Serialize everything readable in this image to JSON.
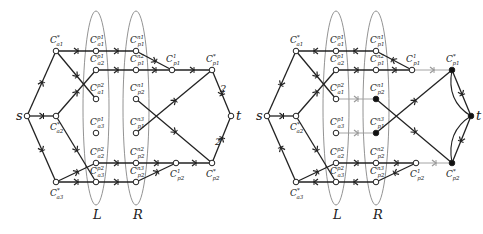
{
  "colors": {
    "edge": "#222222",
    "edge_light": "#9a9a9a",
    "ellipse": "#777777",
    "node_fill_open": "#ffffff",
    "node_fill_closed": "#111111"
  },
  "diagrams": [
    {
      "id": "left",
      "offset_x": 0,
      "ellipse_labels": [
        "L",
        "R"
      ],
      "source_label": "s",
      "sink_label": "t",
      "edge_weights": [
        "2",
        "2"
      ]
    },
    {
      "id": "right",
      "offset_x": 240,
      "ellipse_labels": [
        "L",
        "R"
      ],
      "source_label": "s",
      "sink_label": "t"
    }
  ],
  "node_labels": {
    "a1": "C*a1",
    "a2": "C*a2",
    "a3": "C*a3",
    "L1": "Cp1a1",
    "L2": "Cp1a2",
    "L3": "Cp2a1",
    "L4": "Cp1a3",
    "L5": "Cp2a2",
    "L6": "Cp2a3",
    "R1": "Cn1p1",
    "R2": "Cn2p1",
    "R3": "Cn1p2",
    "R4": "Cn3p2",
    "R5": "Cn2p2",
    "R6": "Cn3p2",
    "p1c": "C1p1",
    "p2c": "C1p2",
    "p1": "C*p1",
    "p2": "C*p2"
  },
  "label_parts": {
    "a1": {
      "sup": "*",
      "sub": "a1"
    },
    "a2": {
      "sup": "*",
      "sub": "a2"
    },
    "a3": {
      "sup": "*",
      "sub": "a3"
    },
    "L1": {
      "sup": "p1",
      "sub": "a1"
    },
    "L2": {
      "sup": "p1",
      "sub": "a2"
    },
    "L3": {
      "sup": "p2",
      "sub": "a1"
    },
    "L4": {
      "sup": "p1",
      "sub": "a3"
    },
    "L5": {
      "sup": "p2",
      "sub": "a2"
    },
    "L6": {
      "sup": "p2",
      "sub": "a3"
    },
    "R1": {
      "sup": "n1",
      "sub": "p1"
    },
    "R2": {
      "sup": "n2",
      "sub": "p1"
    },
    "R3": {
      "sup": "n1",
      "sub": "p2"
    },
    "R4": {
      "sup": "n3",
      "sub": "p1"
    },
    "R5": {
      "sup": "n2",
      "sub": "p2"
    },
    "R6": {
      "sup": "n3",
      "sub": "p2"
    },
    "p1c": {
      "sup": "1",
      "sub": "p1"
    },
    "p2c": {
      "sup": "1",
      "sub": "p2"
    },
    "p1": {
      "sup": "*",
      "sub": "p1"
    },
    "p2": {
      "sup": "*",
      "sub": "p2"
    }
  }
}
